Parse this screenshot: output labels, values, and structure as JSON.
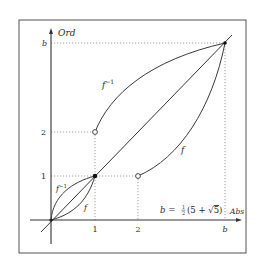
{
  "figure": {
    "axes": {
      "y_label": "Ord",
      "x_label": "Abs"
    },
    "y_ticks": [
      {
        "label": "b",
        "italic": true
      },
      {
        "label": "2",
        "italic": false
      },
      {
        "label": "1",
        "italic": false
      }
    ],
    "x_ticks": [
      {
        "label": "1",
        "italic": false
      },
      {
        "label": "2",
        "italic": false
      },
      {
        "label": "b",
        "italic": true
      }
    ],
    "curves": {
      "upper_inverse_label": "f",
      "upper_inverse_sup": "−1",
      "upper_f_label": "f",
      "lower_inverse_label": "f",
      "lower_inverse_sup": "−1",
      "lower_f_label": "f"
    },
    "formula": {
      "lhs": "b = ",
      "frac_num": "1",
      "frac_den": "2",
      "rhs_open": "(5 + ",
      "sqrt_sign": "√",
      "sqrt_arg": "5",
      "rhs_close": ")"
    },
    "points": {
      "filled": [
        "(0,0)",
        "(1,1)",
        "(b,b)"
      ],
      "open": [
        "(1,2)",
        "(2,1)"
      ]
    },
    "colors": {
      "line": "#3a3a3a",
      "grid": "#9a9a9a",
      "frame": "#555555"
    }
  }
}
